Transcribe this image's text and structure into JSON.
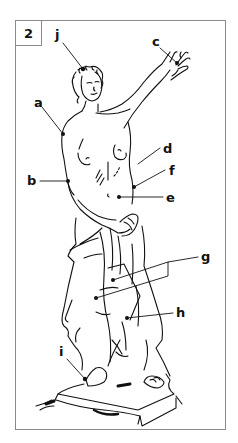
{
  "figure": {
    "number": "2",
    "line_color": "#111111",
    "frame_color": "#8a8a8a"
  },
  "labels": [
    {
      "id": "j",
      "text": "j",
      "x": 55,
      "y": 28,
      "point": [
        83,
        69
      ]
    },
    {
      "id": "c",
      "text": "c",
      "x": 152,
      "y": 35,
      "point": [
        177,
        63
      ]
    },
    {
      "id": "a",
      "text": "a",
      "x": 34,
      "y": 96,
      "point": [
        63,
        134
      ]
    },
    {
      "id": "b",
      "text": "b",
      "x": 27,
      "y": 174,
      "point": [
        68,
        181
      ]
    },
    {
      "id": "d",
      "text": "d",
      "x": 163,
      "y": 142,
      "point": [
        138,
        164
      ]
    },
    {
      "id": "f",
      "text": "f",
      "x": 169,
      "y": 164,
      "point": [
        134,
        187
      ]
    },
    {
      "id": "e",
      "text": "e",
      "x": 166,
      "y": 191,
      "point": [
        119,
        197
      ]
    },
    {
      "id": "g",
      "text": "g",
      "x": 201,
      "y": 250,
      "point": [
        113,
        280
      ]
    },
    {
      "id": "h",
      "text": "h",
      "x": 176,
      "y": 306,
      "point": [
        127,
        318
      ]
    },
    {
      "id": "i",
      "text": "i",
      "x": 59,
      "y": 345,
      "point": [
        85,
        379
      ]
    }
  ]
}
